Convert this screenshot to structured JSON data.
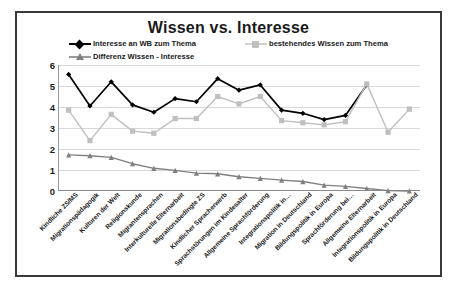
{
  "chart": {
    "title": "Wissen vs. Interesse",
    "frame_border_color": "#3a3a3a",
    "background": "#ffffff"
  },
  "legend": {
    "position": "top",
    "entries": [
      {
        "label": "Interesse an WB zum Thema",
        "color": "#000000",
        "marker": "diamond"
      },
      {
        "label": "bestehendes Wissen zum Thema",
        "color": "#bfbfbf",
        "marker": "square"
      },
      {
        "label": "Differenz Wissen - Interesse",
        "color": "#808080",
        "marker": "triangle"
      }
    ]
  },
  "yaxis": {
    "ticks": [
      "0",
      "1",
      "2",
      "3",
      "4",
      "5",
      "6"
    ],
    "min": 0,
    "max": 6
  },
  "chart_data": {
    "type": "line",
    "title": "Wissen vs. Interesse",
    "xlabel": "",
    "ylabel": "",
    "ylim": [
      0,
      6
    ],
    "grid": true,
    "legend_position": "top",
    "categories": [
      "Kindliche ZS/MS",
      "Migrationspädagogik",
      "Kulturen der Welt",
      "Religionskunde",
      "Migrantensprachen",
      "Interkulturelle Elternarbeit",
      "Migrationsbedingte ZS",
      "Kindlicher Spracherwerb",
      "Sprachstörungen im Kindesalter",
      "Allgemeine Sprachförderung",
      "Integrationspolitik in…",
      "Migration in Deutschland",
      "Bildungspolitik in Europa",
      "Sprachförderung bei…",
      "Allgemeine Elternarbeit",
      "Integrationspolitik in Europa",
      "Bildungspolitik in Deutschland"
    ],
    "series": [
      {
        "name": "Interesse an WB zum Thema",
        "color": "#000000",
        "marker": "diamond",
        "values": [
          5.55,
          4.05,
          5.2,
          4.1,
          3.75,
          4.4,
          4.25,
          5.35,
          4.8,
          5.05,
          3.85,
          3.7,
          3.4,
          3.6,
          5.05,
          null,
          null
        ]
      },
      {
        "name": "bestehendes Wissen zum Thema",
        "color": "#bfbfbf",
        "marker": "square",
        "values": [
          3.85,
          2.4,
          3.65,
          2.85,
          2.75,
          3.45,
          3.45,
          4.5,
          4.15,
          4.5,
          3.35,
          3.25,
          3.15,
          3.3,
          5.1,
          2.8,
          3.9
        ]
      },
      {
        "name": "Differenz Wissen - Interesse",
        "color": "#808080",
        "marker": "triangle",
        "values": [
          1.72,
          1.68,
          1.6,
          1.3,
          1.08,
          0.98,
          0.85,
          0.82,
          0.68,
          0.6,
          0.52,
          0.45,
          0.28,
          0.22,
          0.12,
          0.02,
          0.0
        ]
      }
    ]
  }
}
